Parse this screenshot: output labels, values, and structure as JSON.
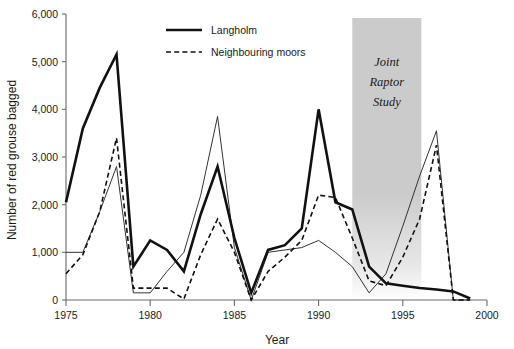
{
  "chart_data": {
    "type": "line",
    "title": "",
    "xlabel": "Year",
    "ylabel": "Number of red grouse bagged",
    "xlim": [
      1975,
      2000
    ],
    "ylim": [
      0,
      6000
    ],
    "xticks": [
      1975,
      1980,
      1985,
      1990,
      1995,
      2000
    ],
    "xtick_labels": [
      "1975",
      "1980",
      "1985",
      "1990",
      "1995",
      "2000"
    ],
    "yticks": [
      0,
      1000,
      2000,
      3000,
      4000,
      5000,
      6000
    ],
    "ytick_labels": [
      "0",
      "1,000",
      "2,000",
      "3,000",
      "4,000",
      "5,000",
      "6,000"
    ],
    "grid": false,
    "legend_position": "top-center",
    "x": [
      1975,
      1976,
      1977,
      1978,
      1979,
      1980,
      1981,
      1982,
      1983,
      1984,
      1985,
      1986,
      1987,
      1988,
      1989,
      1990,
      1991,
      1992,
      1993,
      1994,
      1995,
      1996,
      1997,
      1998,
      1999
    ],
    "series": [
      {
        "name": "Langholm",
        "style": "solid",
        "width": 2.6,
        "color": "#111111",
        "values": [
          2050,
          3600,
          4450,
          5150,
          700,
          1250,
          1050,
          600,
          1800,
          2800,
          1300,
          150,
          1050,
          1150,
          1500,
          4000,
          2050,
          1900,
          700,
          350,
          300,
          250,
          220,
          180,
          30
        ]
      },
      {
        "name": "Neighbouring moors",
        "style": "dashed",
        "width": 1.6,
        "color": "#111111",
        "values": [
          550,
          950,
          1850,
          3400,
          250,
          250,
          250,
          20,
          950,
          1700,
          1000,
          0,
          600,
          900,
          1250,
          2200,
          2150,
          1300,
          400,
          300,
          900,
          1700,
          3250,
          0,
          0
        ]
      },
      {
        "name": "",
        "style": "thin-solid",
        "width": 1.0,
        "color": "#333333",
        "values": [
          1000,
          1000,
          1850,
          2800,
          150,
          150,
          600,
          1000,
          2200,
          3850,
          1100,
          0,
          1000,
          1050,
          1100,
          1250,
          1000,
          700,
          150,
          550,
          1550,
          2600,
          3550,
          0,
          0
        ]
      }
    ],
    "annotations": [
      {
        "name": "joint-raptor-study-band",
        "label": "Joint Raptor Study",
        "label_lines": [
          "Joint",
          "Raptor",
          "Study"
        ],
        "x_start": 1992,
        "x_end": 1996.1,
        "color": "#cccccc"
      }
    ],
    "legend": [
      {
        "label": "Langholm",
        "style": "solid"
      },
      {
        "label": "Neighbouring moors",
        "style": "dashed"
      }
    ]
  }
}
